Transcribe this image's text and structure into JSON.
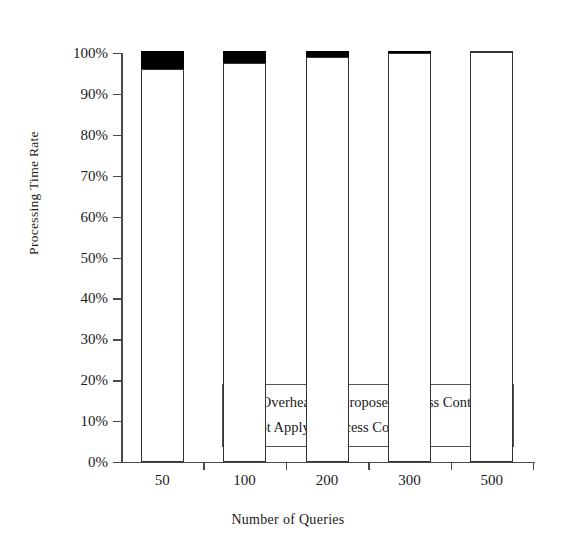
{
  "chart_data": {
    "type": "bar",
    "title": "",
    "xlabel": "Number of Queries",
    "ylabel": "Processing Time Rate",
    "categories": [
      "50",
      "100",
      "200",
      "300",
      "500"
    ],
    "ylim": [
      0,
      100
    ],
    "ytick_labels": [
      "0%",
      "10%",
      "20%",
      "30%",
      "40%",
      "50%",
      "60%",
      "70%",
      "80%",
      "90%",
      "100%"
    ],
    "ytick_values": [
      0,
      10,
      20,
      30,
      40,
      50,
      60,
      70,
      80,
      90,
      100
    ],
    "grid": false,
    "stacked": true,
    "legend_position": "inside-lower-center",
    "series": [
      {
        "name": "Not Apply to Access Control",
        "color": "#ffffff",
        "values": [
          96.0,
          97.5,
          99.0,
          100.0,
          100.5
        ]
      },
      {
        "name": "+ Overhead for Proposed Access Control",
        "color": "#000000",
        "values": [
          4.5,
          3.0,
          1.5,
          0.5,
          0.0
        ]
      }
    ],
    "totals": [
      100.5,
      100.5,
      100.5,
      100.5,
      100.5
    ]
  },
  "legend": {
    "items": [
      {
        "label": "+ Overhead for Proposed Access Control",
        "swatch": "filled-black-square"
      },
      {
        "label": "Not Apply to Access Control",
        "swatch": "hollow-white-square"
      }
    ]
  },
  "colors": {
    "overhead": "#000000",
    "base_fill": "#ffffff",
    "bar_outline": "#333333",
    "axis": "#4a4a4a",
    "background": "#ffffff",
    "text": "#1a1a1a"
  }
}
